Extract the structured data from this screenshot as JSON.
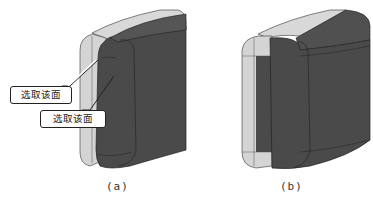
{
  "figures": [
    {
      "id": "a",
      "caption": "(a)",
      "callouts": [
        {
          "label": "选取该面"
        },
        {
          "label": "选取该面"
        }
      ]
    },
    {
      "id": "b",
      "caption": "(b)"
    }
  ],
  "colors": {
    "dark_face": "#4a4a4a",
    "light_face": "#d4d4d4",
    "edge": "#222222",
    "background": "#ffffff"
  }
}
